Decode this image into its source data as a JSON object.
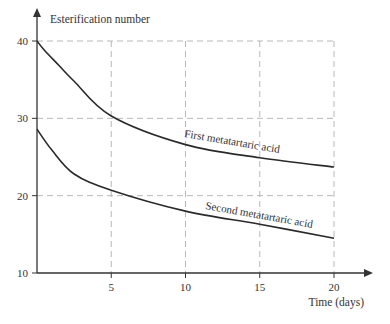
{
  "chart_data": {
    "type": "line",
    "title": "",
    "xlabel": "Time (days)",
    "ylabel": "Esterification number",
    "xlim": [
      0,
      20
    ],
    "ylim": [
      10,
      40
    ],
    "x_ticks": [
      5,
      10,
      15,
      20
    ],
    "y_ticks": [
      10,
      20,
      30,
      40
    ],
    "grid": true,
    "legend": "inline labels along curves",
    "series": [
      {
        "name": "First metatartaric acid",
        "x": [
          0,
          0.5,
          1.5,
          2.5,
          5,
          10,
          15,
          20
        ],
        "y": [
          40,
          38.8,
          36.8,
          34.8,
          30.3,
          26.6,
          24.9,
          23.7
        ]
      },
      {
        "name": "Second metatartaric acid",
        "x": [
          0,
          1,
          2.5,
          5,
          10,
          15,
          20
        ],
        "y": [
          28.6,
          25.9,
          22.8,
          20.7,
          18.0,
          16.3,
          14.5
        ]
      }
    ]
  }
}
